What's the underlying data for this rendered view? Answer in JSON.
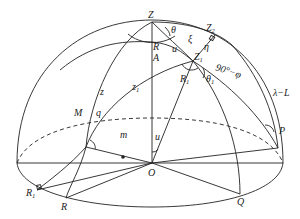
{
  "figure": {
    "type": "celestial-sphere-hemisphere-diagram",
    "labels": {
      "Z": "Z",
      "Z2": "Z",
      "Z2_sub": "2",
      "Z1": "Z",
      "Z1_sub": "1",
      "theta": "θ",
      "xi": "ξ",
      "eta": "η",
      "R": "R",
      "A": "A",
      "u_top": "u",
      "R1_top": "R",
      "R1_top_sub": "1",
      "theta1": "θ",
      "theta1_sub": "1",
      "colat": "90°−φ",
      "z": "z",
      "z1": "z",
      "z1_sub": "1",
      "M": "M",
      "q": "q",
      "m": "m",
      "u_bottom": "u",
      "lambda_L": "λ−L",
      "P": "P",
      "O": "O",
      "R_bottom": "R",
      "R1_bottom": "R",
      "R1_bottom_sub": "1",
      "Q": "Q"
    },
    "colors": {
      "stroke": "#222222",
      "background": "#ffffff"
    }
  }
}
